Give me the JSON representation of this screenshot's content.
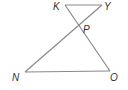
{
  "diagram": {
    "type": "geometry",
    "points": {
      "K": {
        "label": "K",
        "x": 65,
        "y": 5
      },
      "Y": {
        "label": "Y",
        "x": 102,
        "y": 5
      },
      "P": {
        "label": "P",
        "x": 78,
        "y": 26
      },
      "N": {
        "label": "N",
        "x": 25,
        "y": 72
      },
      "O": {
        "label": "O",
        "x": 110,
        "y": 71
      }
    },
    "segments": [
      {
        "from": "K",
        "to": "Y"
      },
      {
        "from": "K",
        "to": "O"
      },
      {
        "from": "Y",
        "to": "N"
      },
      {
        "from": "N",
        "to": "O"
      }
    ],
    "labels": {
      "K": "K",
      "Y": "Y",
      "P": "P",
      "N": "N",
      "O": "O"
    },
    "colors": {
      "line": "#8a8a8a",
      "text": "#333333"
    }
  }
}
